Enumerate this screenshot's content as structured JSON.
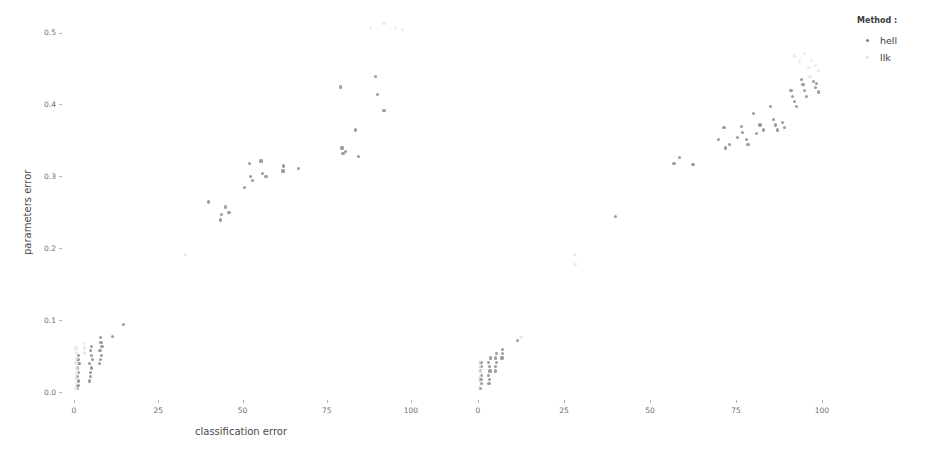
{
  "legend": {
    "title": "Method :",
    "entries": [
      {
        "label": "hell",
        "color": "#7f7f88"
      },
      {
        "label": "llk",
        "color": "#e2e2e6"
      }
    ]
  },
  "axes": {
    "ylabel": "parameters error",
    "xlabel": "classification error",
    "yticks": [
      "0.5",
      "0.4",
      "0.3",
      "0.2",
      "0.1",
      "0.0"
    ],
    "xticks_panel1": [
      "0",
      "25",
      "50",
      "75",
      "100"
    ],
    "xticks_panel2": [
      "0",
      "25",
      "50",
      "75",
      "100"
    ]
  },
  "chart_data": {
    "type": "scatter",
    "title": "",
    "xlabel": "classification error",
    "ylabel": "parameters error",
    "xlim": [
      0,
      108
    ],
    "ylim": [
      0.0,
      0.53
    ],
    "grid": false,
    "legend_position": "right",
    "legend_title": "Method :",
    "facets": [
      {
        "name": "panel-1",
        "series": [
          {
            "name": "hell",
            "color": "#7f7f88",
            "points": [
              [
                1.0,
                0.005
              ],
              [
                1.2,
                0.01
              ],
              [
                1.4,
                0.016
              ],
              [
                1.0,
                0.022
              ],
              [
                1.3,
                0.028
              ],
              [
                1.1,
                0.034
              ],
              [
                1.5,
                0.04
              ],
              [
                1.2,
                0.046
              ],
              [
                1.4,
                0.052
              ],
              [
                4.5,
                0.016
              ],
              [
                4.8,
                0.022
              ],
              [
                5.0,
                0.028
              ],
              [
                5.2,
                0.034
              ],
              [
                4.6,
                0.04
              ],
              [
                5.4,
                0.046
              ],
              [
                5.1,
                0.052
              ],
              [
                4.9,
                0.058
              ],
              [
                5.3,
                0.064
              ],
              [
                7.6,
                0.04
              ],
              [
                7.9,
                0.046
              ],
              [
                8.1,
                0.052
              ],
              [
                7.7,
                0.058
              ],
              [
                8.3,
                0.064
              ],
              [
                8.0,
                0.07
              ],
              [
                7.8,
                0.076
              ],
              [
                11.5,
                0.078
              ],
              [
                14.8,
                0.095
              ],
              [
                40.0,
                0.265
              ],
              [
                43.5,
                0.24
              ],
              [
                43.8,
                0.248
              ],
              [
                45.0,
                0.258
              ],
              [
                46.0,
                0.25
              ],
              [
                50.5,
                0.285
              ],
              [
                52.0,
                0.318
              ],
              [
                52.3,
                0.3
              ],
              [
                53.0,
                0.295
              ],
              [
                55.5,
                0.322
              ],
              [
                56.0,
                0.305
              ],
              [
                57.0,
                0.3
              ],
              [
                62.0,
                0.308
              ],
              [
                62.2,
                0.315
              ],
              [
                66.5,
                0.312
              ],
              [
                79.0,
                0.425
              ],
              [
                79.5,
                0.34
              ],
              [
                79.8,
                0.332
              ],
              [
                80.5,
                0.335
              ],
              [
                83.5,
                0.365
              ],
              [
                84.5,
                0.328
              ],
              [
                89.5,
                0.44
              ],
              [
                90.0,
                0.415
              ],
              [
                92.0,
                0.392
              ]
            ]
          },
          {
            "name": "llk",
            "color": "#e6e6ea",
            "points": [
              [
                0.6,
                0.006
              ],
              [
                0.7,
                0.013
              ],
              [
                0.6,
                0.02
              ],
              [
                0.8,
                0.027
              ],
              [
                0.7,
                0.034
              ],
              [
                0.6,
                0.041
              ],
              [
                0.8,
                0.048
              ],
              [
                0.7,
                0.055
              ],
              [
                0.6,
                0.062
              ],
              [
                3.0,
                0.055
              ],
              [
                3.2,
                0.062
              ],
              [
                2.9,
                0.068
              ],
              [
                33.0,
                0.192
              ],
              [
                88.0,
                0.508
              ],
              [
                92.0,
                0.513
              ],
              [
                95.5,
                0.508
              ],
              [
                97.5,
                0.505
              ]
            ]
          }
        ]
      },
      {
        "name": "panel-2",
        "series": [
          {
            "name": "hell",
            "color": "#7f7f88",
            "points": [
              [
                0.8,
                0.006
              ],
              [
                1.0,
                0.012
              ],
              [
                0.9,
                0.018
              ],
              [
                1.1,
                0.024
              ],
              [
                0.8,
                0.03
              ],
              [
                1.0,
                0.036
              ],
              [
                0.9,
                0.042
              ],
              [
                3.2,
                0.012
              ],
              [
                3.4,
                0.018
              ],
              [
                3.1,
                0.024
              ],
              [
                3.5,
                0.03
              ],
              [
                3.3,
                0.036
              ],
              [
                3.0,
                0.042
              ],
              [
                3.6,
                0.048
              ],
              [
                5.0,
                0.03
              ],
              [
                5.2,
                0.036
              ],
              [
                5.4,
                0.042
              ],
              [
                5.1,
                0.048
              ],
              [
                5.3,
                0.054
              ],
              [
                7.0,
                0.048
              ],
              [
                7.2,
                0.054
              ],
              [
                7.1,
                0.06
              ],
              [
                11.5,
                0.072
              ],
              [
                40.0,
                0.245
              ],
              [
                57.0,
                0.318
              ],
              [
                58.5,
                0.327
              ],
              [
                62.5,
                0.317
              ],
              [
                70.0,
                0.352
              ],
              [
                71.5,
                0.368
              ],
              [
                72.0,
                0.34
              ],
              [
                73.0,
                0.345
              ],
              [
                75.5,
                0.355
              ],
              [
                76.5,
                0.37
              ],
              [
                77.0,
                0.362
              ],
              [
                78.0,
                0.352
              ],
              [
                78.5,
                0.345
              ],
              [
                80.0,
                0.388
              ],
              [
                81.0,
                0.36
              ],
              [
                82.0,
                0.372
              ],
              [
                83.0,
                0.365
              ],
              [
                85.0,
                0.398
              ],
              [
                86.0,
                0.38
              ],
              [
                86.5,
                0.372
              ],
              [
                87.0,
                0.365
              ],
              [
                88.5,
                0.375
              ],
              [
                89.0,
                0.368
              ],
              [
                91.0,
                0.42
              ],
              [
                91.5,
                0.412
              ],
              [
                92.0,
                0.405
              ],
              [
                92.5,
                0.398
              ],
              [
                94.0,
                0.435
              ],
              [
                94.5,
                0.428
              ],
              [
                95.0,
                0.42
              ],
              [
                95.5,
                0.412
              ],
              [
                97.5,
                0.432
              ],
              [
                98.0,
                0.424
              ],
              [
                98.5,
                0.43
              ],
              [
                99.0,
                0.418
              ]
            ]
          },
          {
            "name": "llk",
            "color": "#e6e6ea",
            "points": [
              [
                0.4,
                0.008
              ],
              [
                0.5,
                0.015
              ],
              [
                0.4,
                0.022
              ],
              [
                0.6,
                0.029
              ],
              [
                0.5,
                0.036
              ],
              [
                0.4,
                0.043
              ],
              [
                12.5,
                0.076
              ],
              [
                28.0,
                0.192
              ],
              [
                28.2,
                0.178
              ],
              [
                92.0,
                0.468
              ],
              [
                93.5,
                0.46
              ],
              [
                95.0,
                0.472
              ],
              [
                96.0,
                0.452
              ],
              [
                97.0,
                0.462
              ],
              [
                98.0,
                0.455
              ],
              [
                99.0,
                0.448
              ],
              [
                96.5,
                0.44
              ]
            ]
          }
        ]
      }
    ]
  }
}
